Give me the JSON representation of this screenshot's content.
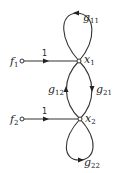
{
  "diagram": {
    "type": "signal-flow-graph",
    "colors": {
      "line": "#333333",
      "text": "#222222",
      "background": "#ffffff"
    },
    "nodes": [
      {
        "id": "f1",
        "label": "f",
        "sub": "1",
        "role": "source"
      },
      {
        "id": "f2",
        "label": "f",
        "sub": "2",
        "role": "source"
      },
      {
        "id": "x1",
        "label": "x",
        "sub": "1",
        "role": "state"
      },
      {
        "id": "x2",
        "label": "x",
        "sub": "2",
        "role": "state"
      }
    ],
    "edges": [
      {
        "from": "f1",
        "to": "x1",
        "gain": "1"
      },
      {
        "from": "f2",
        "to": "x2",
        "gain": "1"
      },
      {
        "from": "x1",
        "to": "x1",
        "gain_label": "g",
        "gain_sub": "11"
      },
      {
        "from": "x1",
        "to": "x2",
        "gain_label": "g",
        "gain_sub": "21"
      },
      {
        "from": "x2",
        "to": "x1",
        "gain_label": "g",
        "gain_sub": "12"
      },
      {
        "from": "x2",
        "to": "x2",
        "gain_label": "g",
        "gain_sub": "22"
      }
    ]
  }
}
